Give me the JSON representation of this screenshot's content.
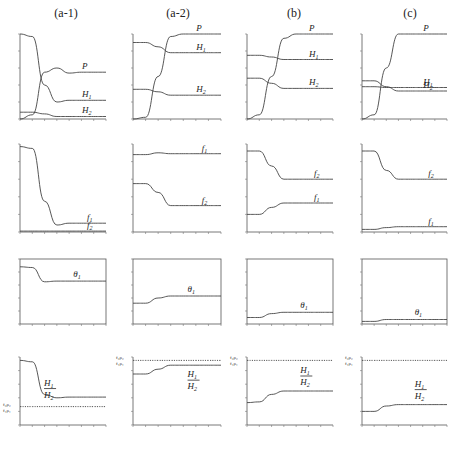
{
  "columns": [
    {
      "id": "a1",
      "title": "(a-1)"
    },
    {
      "id": "a2",
      "title": "(a-2)"
    },
    {
      "id": "b",
      "title": "(b)"
    },
    {
      "id": "c",
      "title": "(c)"
    }
  ],
  "rows": [
    "populations",
    "f",
    "theta",
    "ratio"
  ],
  "labels": {
    "P": "P",
    "H1": "H",
    "H2": "H",
    "f1": "f",
    "f2": "f",
    "theta1": "θ",
    "sub1": "1",
    "sub2": "2",
    "ratio_num": "H",
    "ratio_den": "H",
    "ref_top": "f₂ρ₂",
    "ref_bot": "f₁ρ₁"
  },
  "chart_data": [
    {
      "type": "line",
      "panel": "a-1 row1",
      "title": "(a-1)",
      "xlabel": "",
      "ylabel": "",
      "series": [
        {
          "name": "P",
          "style": "dotted+solid",
          "values": [
            0,
            0.05,
            0.55,
            0.6,
            0.54,
            0.55,
            0.55,
            0.55
          ]
        },
        {
          "name": "H1",
          "values": [
            1.0,
            0.97,
            0.4,
            0.2,
            0.22,
            0.22,
            0.22,
            0.22
          ]
        },
        {
          "name": "H2",
          "values": [
            0.08,
            0.08,
            0.06,
            0.03,
            0.03,
            0.03,
            0.03,
            0.03
          ]
        }
      ]
    },
    {
      "type": "line",
      "panel": "a-2 row1",
      "title": "(a-2)",
      "series": [
        {
          "name": "P",
          "values": [
            0,
            0.02,
            0.5,
            0.97,
            1.0,
            1.0,
            1.0,
            1.0
          ]
        },
        {
          "name": "H1",
          "values": [
            0.9,
            0.9,
            0.85,
            0.78,
            0.78,
            0.78,
            0.78,
            0.78
          ]
        },
        {
          "name": "H2",
          "values": [
            0.35,
            0.35,
            0.32,
            0.28,
            0.28,
            0.28,
            0.28,
            0.28
          ]
        }
      ]
    },
    {
      "type": "line",
      "panel": "b row1",
      "title": "(b)",
      "series": [
        {
          "name": "P",
          "values": [
            0,
            0.05,
            0.5,
            0.95,
            1.0,
            1.0,
            1.0,
            1.0
          ]
        },
        {
          "name": "H1",
          "values": [
            0.75,
            0.75,
            0.73,
            0.7,
            0.7,
            0.7,
            0.7,
            0.7
          ]
        },
        {
          "name": "H2",
          "values": [
            0.48,
            0.48,
            0.42,
            0.36,
            0.36,
            0.36,
            0.36,
            0.36
          ]
        }
      ]
    },
    {
      "type": "line",
      "panel": "c row1",
      "title": "(c)",
      "series": [
        {
          "name": "P",
          "values": [
            0,
            0.05,
            0.6,
            1.0,
            1.0,
            1.0,
            1.0,
            1.0
          ]
        },
        {
          "name": "H1",
          "values": [
            0.38,
            0.38,
            0.37,
            0.37,
            0.37,
            0.37,
            0.37,
            0.37
          ]
        },
        {
          "name": "H2",
          "values": [
            0.45,
            0.45,
            0.38,
            0.33,
            0.33,
            0.33,
            0.33,
            0.33
          ]
        }
      ]
    },
    {
      "type": "line",
      "panel": "a-1 row2",
      "series": [
        {
          "name": "f1",
          "values": [
            0.97,
            0.95,
            0.35,
            0.08,
            0.1,
            0.1,
            0.1,
            0.1
          ]
        },
        {
          "name": "f2",
          "values": [
            0.01,
            0.01,
            0.01,
            0.01,
            0.01,
            0.01,
            0.01,
            0.01
          ]
        }
      ]
    },
    {
      "type": "line",
      "panel": "a-2 row2",
      "series": [
        {
          "name": "f1",
          "values": [
            0.88,
            0.88,
            0.9,
            0.89,
            0.89,
            0.89,
            0.89,
            0.89
          ]
        },
        {
          "name": "f2",
          "values": [
            0.55,
            0.55,
            0.45,
            0.3,
            0.3,
            0.3,
            0.3,
            0.3
          ]
        }
      ]
    },
    {
      "type": "line",
      "panel": "b row2",
      "series": [
        {
          "name": "f2",
          "values": [
            0.92,
            0.92,
            0.75,
            0.6,
            0.6,
            0.6,
            0.6,
            0.6
          ]
        },
        {
          "name": "f1",
          "values": [
            0.2,
            0.2,
            0.28,
            0.33,
            0.33,
            0.33,
            0.33,
            0.33
          ]
        }
      ]
    },
    {
      "type": "line",
      "panel": "c row2",
      "series": [
        {
          "name": "f2",
          "values": [
            0.92,
            0.92,
            0.7,
            0.6,
            0.6,
            0.6,
            0.6,
            0.6
          ]
        },
        {
          "name": "f1",
          "values": [
            0.03,
            0.03,
            0.05,
            0.06,
            0.06,
            0.06,
            0.06,
            0.06
          ]
        }
      ]
    },
    {
      "type": "line",
      "panel": "a-1 row3",
      "series": [
        {
          "name": "theta1",
          "values": [
            0.88,
            0.87,
            0.65,
            0.66,
            0.66,
            0.66,
            0.66,
            0.66
          ]
        }
      ]
    },
    {
      "type": "line",
      "panel": "a-2 row3",
      "series": [
        {
          "name": "theta1",
          "values": [
            0.32,
            0.32,
            0.4,
            0.43,
            0.43,
            0.43,
            0.43,
            0.43
          ]
        }
      ]
    },
    {
      "type": "line",
      "panel": "b row3",
      "series": [
        {
          "name": "theta1",
          "values": [
            0.1,
            0.1,
            0.16,
            0.18,
            0.18,
            0.18,
            0.18,
            0.18
          ]
        }
      ]
    },
    {
      "type": "line",
      "panel": "c row3",
      "series": [
        {
          "name": "theta1",
          "values": [
            0.04,
            0.04,
            0.07,
            0.07,
            0.07,
            0.07,
            0.07,
            0.07
          ]
        }
      ]
    },
    {
      "type": "line",
      "panel": "a-1 row4",
      "series": [
        {
          "name": "H1/H2",
          "values": [
            0.95,
            0.93,
            0.45,
            0.4,
            0.41,
            0.41,
            0.41,
            0.41
          ]
        },
        {
          "name": "f2ρ2/f1ρ1",
          "style": "dotted",
          "values": [
            0.27,
            0.27,
            0.27,
            0.27,
            0.27,
            0.27,
            0.27,
            0.27
          ]
        }
      ]
    },
    {
      "type": "line",
      "panel": "a-2 row4",
      "series": [
        {
          "name": "H1/H2",
          "values": [
            0.75,
            0.75,
            0.82,
            0.88,
            0.88,
            0.88,
            0.88,
            0.88
          ]
        },
        {
          "name": "f2ρ2/f1ρ1",
          "style": "dotted",
          "values": [
            0.95,
            0.95,
            0.95,
            0.95,
            0.95,
            0.95,
            0.95,
            0.95
          ]
        }
      ]
    },
    {
      "type": "line",
      "panel": "b row4",
      "series": [
        {
          "name": "H1/H2",
          "values": [
            0.33,
            0.34,
            0.45,
            0.5,
            0.5,
            0.5,
            0.5,
            0.5
          ]
        },
        {
          "name": "f2ρ2/f1ρ1",
          "style": "dotted",
          "values": [
            0.95,
            0.95,
            0.95,
            0.95,
            0.95,
            0.95,
            0.95,
            0.95
          ]
        }
      ]
    },
    {
      "type": "line",
      "panel": "c row4",
      "series": [
        {
          "name": "H1/H2",
          "values": [
            0.2,
            0.2,
            0.28,
            0.3,
            0.3,
            0.3,
            0.3,
            0.3
          ]
        },
        {
          "name": "f2ρ2/f1ρ1",
          "style": "dotted",
          "values": [
            0.95,
            0.95,
            0.95,
            0.95,
            0.95,
            0.95,
            0.95,
            0.95
          ]
        }
      ]
    }
  ]
}
